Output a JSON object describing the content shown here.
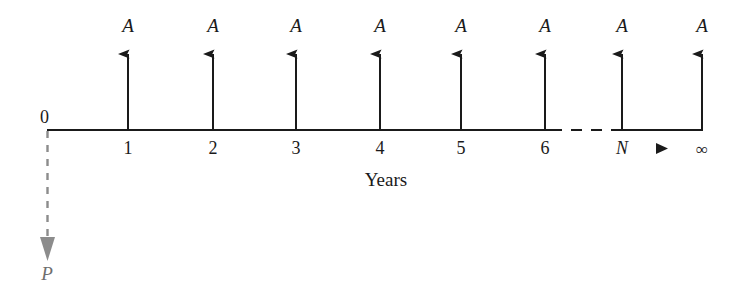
{
  "diagram": {
    "type": "cash-flow-diagram",
    "axis_label": "Years",
    "origin_label": "0",
    "present_value_label": "P",
    "continuation_marker": "▶",
    "colors": {
      "line": "#1a1a1a",
      "text": "#1a1a1a",
      "present_value": "#808080",
      "background": "#ffffff"
    },
    "geometry": {
      "baseline_y": 130,
      "baseline_x_start": 47,
      "baseline_x_end": 702,
      "arrow_tip_y": 42,
      "p_arrow_tip_y": 262
    },
    "periods": [
      {
        "tick_label": "1",
        "x": 128,
        "inflow_label": "A",
        "italic_tick": false
      },
      {
        "tick_label": "2",
        "x": 213,
        "inflow_label": "A",
        "italic_tick": false
      },
      {
        "tick_label": "3",
        "x": 296,
        "inflow_label": "A",
        "italic_tick": false
      },
      {
        "tick_label": "4",
        "x": 380,
        "inflow_label": "A",
        "italic_tick": false
      },
      {
        "tick_label": "5",
        "x": 461,
        "inflow_label": "A",
        "italic_tick": false
      },
      {
        "tick_label": "6",
        "x": 545,
        "inflow_label": "A",
        "italic_tick": false
      },
      {
        "tick_label": "N",
        "x": 622,
        "inflow_label": "A",
        "italic_tick": true
      },
      {
        "tick_label": "∞",
        "x": 702,
        "inflow_label": "A",
        "italic_tick": false
      }
    ],
    "dashed_baseline_segment": {
      "from_x": 551,
      "to_x": 616
    },
    "continuation_marker_x": 662
  }
}
